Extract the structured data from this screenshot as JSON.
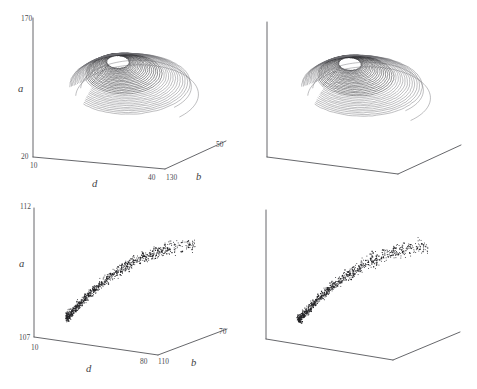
{
  "figure": {
    "background": "#ffffff",
    "ink_color": "#2b2b2e",
    "axis_color": "#55565a",
    "layout": "2x2 stereo pair grid; left column labelled, right column unlabelled stereo partner"
  },
  "panels": {
    "top_left": {
      "name": "attractor-stereo-left",
      "axes": {
        "vertical": {
          "label": "a",
          "max": "170",
          "min": "20"
        },
        "left_horizontal": {
          "label": "d",
          "near": "10",
          "far": "40"
        },
        "right_horizontal": {
          "label": "b",
          "near": "130",
          "far": "50"
        }
      }
    },
    "top_right": {
      "name": "attractor-stereo-right",
      "axes": {
        "vertical": {
          "label": "",
          "max": "",
          "min": ""
        },
        "left_horizontal": {
          "label": "",
          "near": "",
          "far": ""
        },
        "right_horizontal": {
          "label": "",
          "near": "",
          "far": ""
        }
      }
    },
    "bottom_left": {
      "name": "scatter-stereo-left",
      "axes": {
        "vertical": {
          "label": "a",
          "max": "112",
          "min": "107"
        },
        "left_horizontal": {
          "label": "d",
          "near": "10",
          "far": "80"
        },
        "right_horizontal": {
          "label": "b",
          "near": "110",
          "far": "70"
        }
      }
    },
    "bottom_right": {
      "name": "scatter-stereo-right",
      "axes": {
        "vertical": {
          "label": "",
          "max": "",
          "min": ""
        },
        "left_horizontal": {
          "label": "",
          "near": "",
          "far": ""
        },
        "right_horizontal": {
          "label": "",
          "near": "",
          "far": ""
        }
      }
    }
  },
  "chart_data": [
    {
      "type": "line",
      "id": "top-attractor",
      "title": "",
      "xlabel": "d",
      "ylabel": "a",
      "zlabel": "b",
      "projection": "3d-wireframe-trajectory",
      "xlim": [
        10,
        40
      ],
      "ylim": [
        20,
        170
      ],
      "zlim": [
        130,
        50
      ],
      "grid": false,
      "legend": "none",
      "description": "Chaotic attractor trajectory: nested spiral bands forming a funnel, dense tight coils at upper-left opening into wide outer loops toward lower-right",
      "series": [
        {
          "name": "trajectory",
          "loops": 34,
          "spiral_center_x": 0.36,
          "spiral_center_y": 0.42,
          "radius_min": 0.045,
          "radius_max": 0.33,
          "tilt_deg": -18
        }
      ]
    },
    {
      "type": "line",
      "id": "top-attractor-stereo",
      "title": "",
      "xlabel": "",
      "ylabel": "",
      "zlabel": "",
      "projection": "3d-wireframe-trajectory",
      "xlim": [
        10,
        40
      ],
      "ylim": [
        20,
        170
      ],
      "zlim": [
        130,
        50
      ],
      "grid": false,
      "legend": "none",
      "description": "Same attractor rendered from a slightly rotated viewpoint for stereo viewing",
      "series": [
        {
          "name": "trajectory",
          "loops": 34,
          "spiral_center_x": 0.355,
          "spiral_center_y": 0.42,
          "radius_min": 0.045,
          "radius_max": 0.33,
          "tilt_deg": -16
        }
      ]
    },
    {
      "type": "scatter",
      "id": "bottom-scatter",
      "title": "",
      "xlabel": "d",
      "ylabel": "a",
      "zlabel": "b",
      "projection": "3d-point-cloud",
      "xlim": [
        10,
        80
      ],
      "ylim": [
        107,
        112
      ],
      "zlim": [
        110,
        70
      ],
      "grid": false,
      "legend": "none",
      "n_points": 760,
      "description": "Curved arc-shaped point cloud rising from lower-left to upper-right, dense at the left elbow and diffuse toward the upper right tail"
    },
    {
      "type": "scatter",
      "id": "bottom-scatter-stereo",
      "title": "",
      "xlabel": "",
      "ylabel": "",
      "zlabel": "",
      "projection": "3d-point-cloud",
      "xlim": [
        10,
        80
      ],
      "ylim": [
        107,
        112
      ],
      "zlim": [
        110,
        70
      ],
      "grid": false,
      "legend": "none",
      "n_points": 760,
      "description": "Same point cloud from a slightly rotated viewpoint for stereo viewing"
    }
  ]
}
